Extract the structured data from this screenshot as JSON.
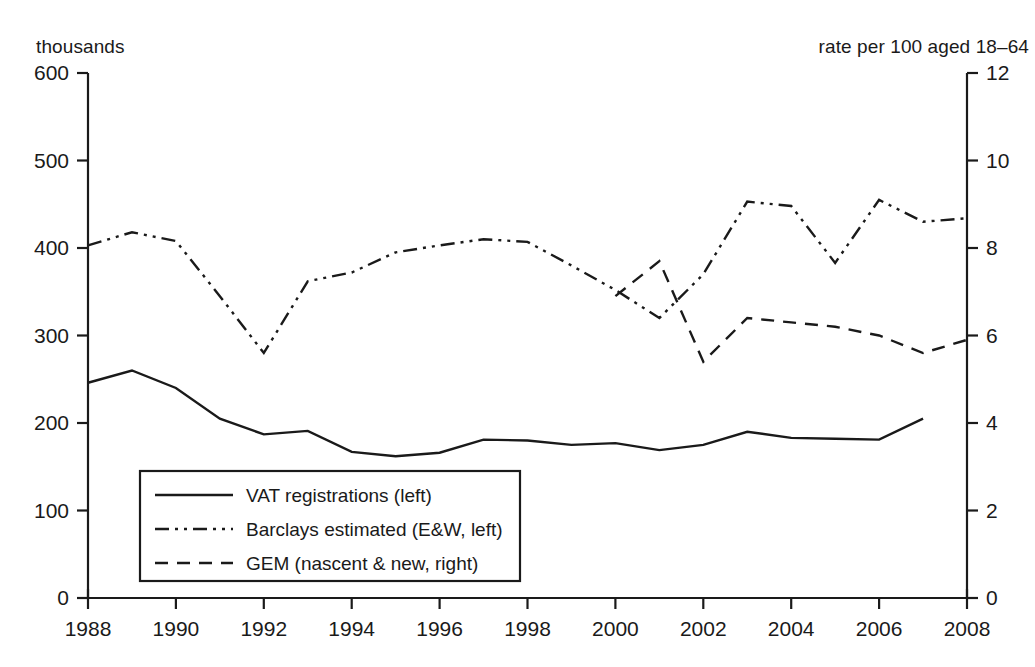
{
  "axis_captions": {
    "left": "thousands",
    "right": "rate per 100 aged 18–64"
  },
  "legend": {
    "items": [
      {
        "label": "VAT registrations (left)",
        "style": "solid"
      },
      {
        "label": "Barclays estimated (E&W, left)",
        "style": "dash-dot-dot"
      },
      {
        "label": "GEM (nascent & new, right)",
        "style": "dashed"
      }
    ]
  },
  "chart_data": {
    "type": "line",
    "title": "",
    "xlabel": "",
    "ylabel": "thousands",
    "y2label": "rate per 100 aged 18–64",
    "grid": false,
    "legend_position": "lower-left-inside",
    "xlim": [
      1988,
      2008
    ],
    "xticks": [
      1988,
      1990,
      1992,
      1994,
      1996,
      1998,
      2000,
      2002,
      2004,
      2006,
      2008
    ],
    "xtick_labels": [
      "1988",
      "1990",
      "1992",
      "1994",
      "1996",
      "1998",
      "2000",
      "2002",
      "2004",
      "2006",
      "2008"
    ],
    "xtick_minor": [
      1989,
      1991,
      1993,
      1995,
      1997,
      1999,
      2001,
      2003,
      2005,
      2007
    ],
    "ylim": [
      0,
      600
    ],
    "yticks": [
      0,
      100,
      200,
      300,
      400,
      500,
      600
    ],
    "ytick_labels": [
      "0",
      "100",
      "200",
      "300",
      "400",
      "500",
      "600"
    ],
    "y2lim": [
      0,
      12
    ],
    "y2ticks": [
      0,
      2,
      4,
      6,
      8,
      10,
      12
    ],
    "y2tick_labels": [
      "0",
      "2",
      "4",
      "6",
      "8",
      "10",
      "12"
    ],
    "series": [
      {
        "name": "VAT registrations (left)",
        "axis": "left",
        "style": "solid",
        "x": [
          1988,
          1989,
          1990,
          1991,
          1992,
          1993,
          1994,
          1995,
          1996,
          1997,
          1998,
          1999,
          2000,
          2001,
          2002,
          2003,
          2004,
          2005,
          2006,
          2007
        ],
        "values": [
          246,
          260,
          240,
          205,
          187,
          191,
          167,
          162,
          166,
          181,
          180,
          175,
          177,
          169,
          175,
          190,
          183,
          182,
          181,
          205
        ]
      },
      {
        "name": "Barclays estimated (E&W, left)",
        "axis": "left",
        "style": "dash-dot-dot",
        "x": [
          1988,
          1989,
          1990,
          1991,
          1992,
          1993,
          1994,
          1995,
          1996,
          1997,
          1998,
          1999,
          2000,
          2001,
          2002,
          2003,
          2004,
          2005,
          2006,
          2007,
          2008
        ],
        "values": [
          403,
          418,
          408,
          345,
          280,
          362,
          372,
          395,
          403,
          410,
          407,
          380,
          352,
          320,
          370,
          453,
          448,
          383,
          455,
          430,
          434
        ]
      },
      {
        "name": "GEM (nascent & new, right)",
        "axis": "right",
        "style": "dashed",
        "x": [
          2000,
          2001,
          2002,
          2003,
          2004,
          2005,
          2006,
          2007,
          2008
        ],
        "values": [
          6.9,
          7.7,
          5.4,
          6.4,
          6.3,
          6.2,
          6.0,
          5.6,
          5.9
        ]
      }
    ]
  }
}
